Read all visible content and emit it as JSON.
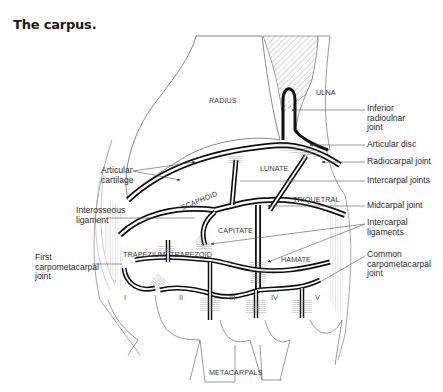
{
  "figure": {
    "title": "The carpus."
  },
  "bones": {
    "radius": "RADIUS",
    "ulna": "ULNA",
    "lunate": "LUNATE",
    "scaphoid": "SCAPHOID",
    "triquetral": "TRIQUETRAL",
    "capitate": "CAPITATE",
    "trapezium": "TRAPEZIUM",
    "trapezoid": "TRAPEZOID",
    "hamate": "HAMATE",
    "metacarpals": "METACARPALS"
  },
  "metacarpal_numerals": [
    "I",
    "II",
    "III",
    "IV",
    "V"
  ],
  "labels_right": [
    {
      "id": "inferior-radioulnar-joint",
      "text": "Inferior\nradioulnar\njoint"
    },
    {
      "id": "articular-disc",
      "text": "Articular disc"
    },
    {
      "id": "radiocarpal-joint",
      "text": "Radiocarpal joint"
    },
    {
      "id": "intercarpal-joints",
      "text": "Intercarpal joints"
    },
    {
      "id": "midcarpal-joint",
      "text": "Midcarpal joint"
    },
    {
      "id": "intercarpal-ligaments",
      "text": "Intercarpal\nligaments"
    },
    {
      "id": "common-carpometacarpal-joint",
      "text": "Common\ncarpometacarpal\njoint"
    }
  ],
  "labels_left": [
    {
      "id": "articular-cartilage",
      "text": "Articular\ncartilage"
    },
    {
      "id": "interosseous-ligament",
      "text": "Interosseous\nligament"
    },
    {
      "id": "first-carpometacarpal-joint",
      "text": "First\ncarpometacarpal\njoint"
    }
  ]
}
